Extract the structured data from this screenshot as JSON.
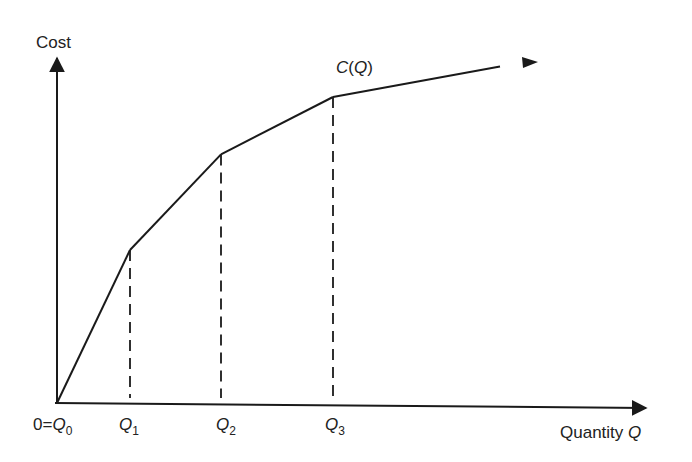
{
  "diagram": {
    "y_axis_label": "Cost",
    "x_axis_label": "Quantity",
    "x_axis_var": "Q",
    "curve_label": {
      "func": "C",
      "arg": "Q"
    },
    "origin_label": {
      "prefix": "0=",
      "var": "Q",
      "sub": "0"
    },
    "breakpoints": [
      {
        "var": "Q",
        "sub": "1"
      },
      {
        "var": "Q",
        "sub": "2"
      },
      {
        "var": "Q",
        "sub": "3"
      }
    ],
    "colors": {
      "line": "#1a1a1a",
      "text": "#222222",
      "background": "#ffffff"
    }
  },
  "chart_data": {
    "type": "line",
    "title": "",
    "xlabel": "Quantity Q",
    "ylabel": "Cost",
    "series": [
      {
        "name": "C(Q)",
        "x": [
          0,
          1,
          2,
          3,
          4.5
        ],
        "y": [
          0,
          2.0,
          3.25,
          4.0,
          4.4
        ]
      }
    ],
    "x_tick_labels": [
      "0=Q0",
      "Q1",
      "Q2",
      "Q3"
    ],
    "x_ticks": [
      0,
      1,
      2,
      3
    ],
    "dashed_guides_at_x": [
      1,
      2,
      3
    ],
    "segments_decreasing_slope": true,
    "grid": false,
    "legend": "none"
  }
}
